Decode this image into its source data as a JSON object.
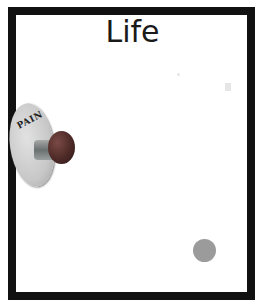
{
  "slide": {
    "title": "Life",
    "button": {
      "label": "PAIN",
      "cap_color": "#4d2a27",
      "disc_color": "#c8c8c8"
    },
    "dot": {
      "color": "#9b9b9b"
    },
    "frame_color": "#111111"
  }
}
